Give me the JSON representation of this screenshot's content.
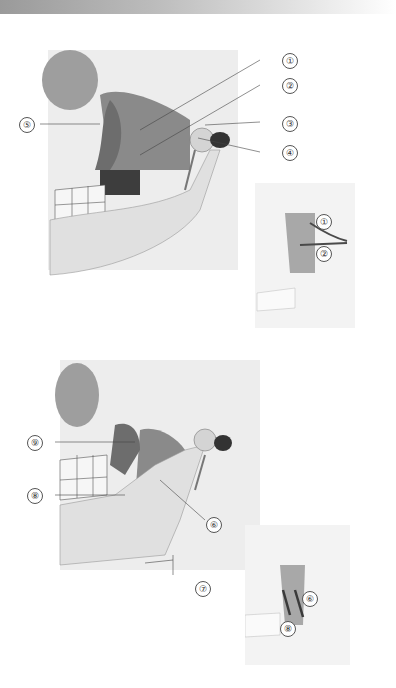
{
  "figure": {
    "panels": [
      {
        "name": "upper-main",
        "labels": [
          "1",
          "2",
          "3",
          "4",
          "5"
        ]
      },
      {
        "name": "upper-inset",
        "labels": [
          "1",
          "2"
        ]
      },
      {
        "name": "lower-main",
        "labels": [
          "9",
          "8",
          "6",
          "7"
        ]
      },
      {
        "name": "lower-inset",
        "labels": [
          "6",
          "8"
        ]
      }
    ],
    "callouts": {
      "c1": "①",
      "c2": "②",
      "c3": "③",
      "c4": "④",
      "c5": "⑤",
      "i1": "①",
      "i2": "②",
      "c9": "⑨",
      "c8": "⑧",
      "c6": "⑥",
      "c7": "⑦",
      "i6": "⑥",
      "i8": "⑧"
    },
    "colors": {
      "bone": "#e6e6e6",
      "muscle": "#8c8c8c",
      "dark": "#3a3a3a",
      "accent_line": "#5a5a5a"
    }
  }
}
